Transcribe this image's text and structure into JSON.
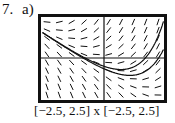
{
  "problem": {
    "number": "7.",
    "part": "a)",
    "caption": "[−2.5, 2.5] x [−2.5, 2.5]"
  },
  "chart_data": {
    "type": "slope_field",
    "title": "",
    "window": {
      "xmin": -2.5,
      "xmax": 2.5,
      "ymin": -2.5,
      "ymax": 2.5
    },
    "window_label": "[−2.5, 2.5] x [−2.5, 2.5]",
    "axes_visible": true,
    "grid": false,
    "field": "dy/dx = x + y",
    "grid_columns": 10,
    "grid_rows": 10,
    "solution_curves": [
      {
        "description": "curve through upper-left descending to lower-right",
        "form": "y = -x - 1 + C e^x",
        "C": 0.35
      },
      {
        "description": "second nearby curve descending to lower-right",
        "form": "y = -x - 1 + C e^x",
        "C": 0.5
      }
    ],
    "colors": {
      "line": "#111111",
      "background": "#ffffff"
    }
  }
}
